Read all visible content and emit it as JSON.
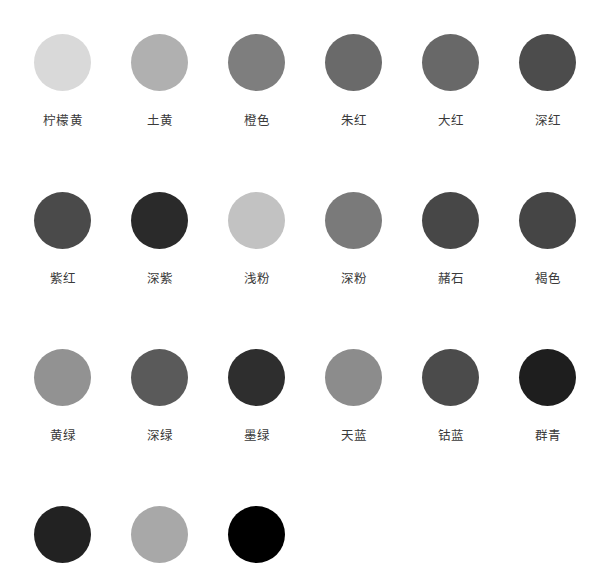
{
  "swatches": [
    {
      "label": "柠檬黄",
      "color": "#d9d9d9"
    },
    {
      "label": "土黄",
      "color": "#b0b0b0"
    },
    {
      "label": "橙色",
      "color": "#7e7e7e"
    },
    {
      "label": "朱红",
      "color": "#6a6a6a"
    },
    {
      "label": "大红",
      "color": "#686868"
    },
    {
      "label": "深红",
      "color": "#4c4c4c"
    },
    {
      "label": "紫红",
      "color": "#4a4a4a"
    },
    {
      "label": "深紫",
      "color": "#2a2a2a"
    },
    {
      "label": "浅粉",
      "color": "#c2c2c2"
    },
    {
      "label": "深粉",
      "color": "#7a7a7a"
    },
    {
      "label": "赭石",
      "color": "#474747"
    },
    {
      "label": "褐色",
      "color": "#454545"
    },
    {
      "label": "黄绿",
      "color": "#929292"
    },
    {
      "label": "深绿",
      "color": "#5a5a5a"
    },
    {
      "label": "墨绿",
      "color": "#2e2e2e"
    },
    {
      "label": "天蓝",
      "color": "#8c8c8c"
    },
    {
      "label": "钴蓝",
      "color": "#4b4b4b"
    },
    {
      "label": "群青",
      "color": "#1e1e1e"
    },
    {
      "label": "",
      "color": "#222222"
    },
    {
      "label": "",
      "color": "#a8a8a8"
    },
    {
      "label": "",
      "color": "#000000"
    }
  ],
  "layout": {
    "columns": 6,
    "col_x": [
      63,
      160,
      257,
      354,
      451,
      548
    ],
    "row_y": [
      62,
      220,
      377,
      534
    ]
  }
}
